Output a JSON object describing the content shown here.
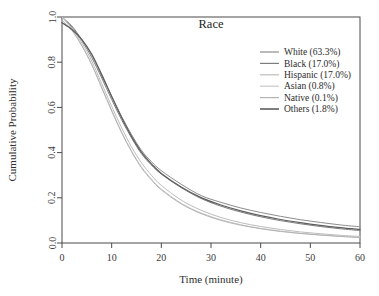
{
  "chart_data": {
    "type": "line",
    "title": "Race",
    "xlabel": "Time (minute)",
    "ylabel": "Cumulative Probability",
    "xlim": [
      0,
      60
    ],
    "ylim": [
      0.0,
      1.0
    ],
    "xticks": [
      0,
      10,
      20,
      30,
      40,
      50,
      60
    ],
    "xtick_labels": [
      "0",
      "10",
      "20",
      "30",
      "40",
      "50",
      "60"
    ],
    "yticks": [
      0.0,
      0.2,
      0.4,
      0.6,
      0.8,
      1.0
    ],
    "ytick_labels": [
      "0.0",
      "0.2",
      "0.4",
      "0.6",
      "0.8",
      "1.0"
    ],
    "grid": false,
    "legend_position": "top-right",
    "x": [
      0,
      2,
      4,
      6,
      8,
      10,
      12,
      14,
      16,
      18,
      20,
      24,
      28,
      32,
      36,
      40,
      44,
      48,
      52,
      56,
      60
    ],
    "series": [
      {
        "name": "White (63.3%)",
        "label": "White (63.3%)",
        "percent": "63.3%",
        "color": "#8c8c8c",
        "values": [
          1.0,
          0.96,
          0.9,
          0.83,
          0.74,
          0.65,
          0.56,
          0.48,
          0.41,
          0.36,
          0.32,
          0.26,
          0.21,
          0.18,
          0.155,
          0.135,
          0.118,
          0.103,
          0.091,
          0.08,
          0.072
        ]
      },
      {
        "name": "Black (17.0%)",
        "label": "Black (17.0%)",
        "percent": "17.0%",
        "color": "#7d7d7d",
        "values": [
          1.0,
          0.955,
          0.895,
          0.82,
          0.73,
          0.635,
          0.545,
          0.465,
          0.395,
          0.345,
          0.305,
          0.245,
          0.197,
          0.163,
          0.137,
          0.116,
          0.099,
          0.085,
          0.073,
          0.063,
          0.055
        ]
      },
      {
        "name": "Hispanic (17.0%)",
        "label": "Hispanic (17.0%)",
        "percent": "17.0%",
        "color": "#bdbdbd",
        "values": [
          1.0,
          0.95,
          0.885,
          0.805,
          0.705,
          0.605,
          0.51,
          0.425,
          0.355,
          0.3,
          0.255,
          0.19,
          0.145,
          0.113,
          0.09,
          0.073,
          0.06,
          0.049,
          0.041,
          0.034,
          0.029
        ]
      },
      {
        "name": "Asian (0.8%)",
        "label": "Asian (0.8%)",
        "percent": "0.8%",
        "color": "#c9c9c9",
        "values": [
          1.0,
          0.945,
          0.875,
          0.79,
          0.69,
          0.588,
          0.492,
          0.408,
          0.337,
          0.283,
          0.239,
          0.176,
          0.133,
          0.103,
          0.081,
          0.065,
          0.053,
          0.043,
          0.036,
          0.03,
          0.025
        ]
      },
      {
        "name": "Native (0.1%)",
        "label": "Native (0.1%)",
        "percent": "0.1%",
        "color": "#b3b3b3",
        "values": [
          0.985,
          0.94,
          0.872,
          0.788,
          0.686,
          0.584,
          0.488,
          0.404,
          0.333,
          0.279,
          0.235,
          0.173,
          0.13,
          0.1,
          0.079,
          0.063,
          0.051,
          0.042,
          0.035,
          0.029,
          0.024
        ]
      },
      {
        "name": "Others (1.8%)",
        "label": "Others (1.8%)",
        "percent": "1.8%",
        "color": "#5e5e5e",
        "values": [
          0.975,
          0.945,
          0.9,
          0.835,
          0.745,
          0.648,
          0.555,
          0.472,
          0.402,
          0.35,
          0.308,
          0.248,
          0.201,
          0.168,
          0.142,
          0.121,
          0.104,
          0.09,
          0.078,
          0.068,
          0.06
        ]
      }
    ]
  },
  "legend": {
    "entries": [
      {
        "label": "White (63.3%)"
      },
      {
        "label": "Black (17.0%)"
      },
      {
        "label": "Hispanic (17.0%)"
      },
      {
        "label": "Asian (0.8%)"
      },
      {
        "label": "Native (0.1%)"
      },
      {
        "label": "Others (1.8%)"
      }
    ]
  }
}
